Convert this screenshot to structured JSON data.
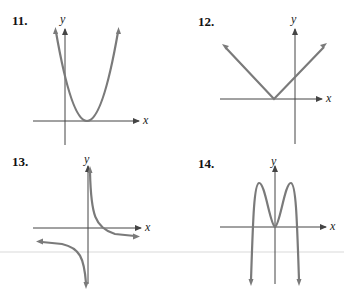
{
  "problems": [
    {
      "number": "11.",
      "x_label": "x",
      "y_label": "y",
      "shape": "upward parabola, vertex on positive x-axis"
    },
    {
      "number": "12.",
      "x_label": "x",
      "y_label": "y",
      "shape": "absolute value V, vertex on negative x-axis"
    },
    {
      "number": "13.",
      "x_label": "x",
      "y_label": "y",
      "shape": "hyperbola branches in quadrants I and III"
    },
    {
      "number": "14.",
      "x_label": "x",
      "y_label": "y",
      "shape": "W-shaped quartic, local min at origin, opens downward"
    }
  ],
  "colors": {
    "curve": "#7a7a7a",
    "axis": "#444444"
  }
}
